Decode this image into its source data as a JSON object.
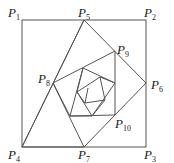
{
  "diagram": {
    "line_color": "#555555",
    "labels": [
      {
        "id": "P1",
        "base": "P",
        "sub": "1",
        "x": 8,
        "y": 6
      },
      {
        "id": "P5",
        "base": "P",
        "sub": "5",
        "x": 78,
        "y": 6
      },
      {
        "id": "P2",
        "base": "P",
        "sub": "2",
        "x": 144,
        "y": 6
      },
      {
        "id": "P9",
        "base": "P",
        "sub": "9",
        "x": 117,
        "y": 43
      },
      {
        "id": "P8",
        "base": "P",
        "sub": "8",
        "x": 38,
        "y": 72
      },
      {
        "id": "P6",
        "base": "P",
        "sub": "6",
        "x": 151,
        "y": 78
      },
      {
        "id": "P10",
        "base": "P",
        "sub": "10",
        "x": 115,
        "y": 117
      },
      {
        "id": "P4",
        "base": "P",
        "sub": "4",
        "x": 8,
        "y": 148
      },
      {
        "id": "P7",
        "base": "P",
        "sub": "7",
        "x": 78,
        "y": 148
      },
      {
        "id": "P3",
        "base": "P",
        "sub": "3",
        "x": 144,
        "y": 148
      }
    ],
    "points": {
      "P1": [
        22,
        20
      ],
      "P2": [
        146,
        20
      ],
      "P3": [
        146,
        147
      ],
      "P4": [
        22,
        147
      ],
      "P5": [
        84,
        20
      ],
      "P6": [
        146,
        83
      ],
      "P7": [
        84,
        147
      ],
      "P8": [
        53,
        83
      ],
      "P9": [
        115,
        51
      ],
      "P10": [
        115,
        115
      ]
    }
  }
}
